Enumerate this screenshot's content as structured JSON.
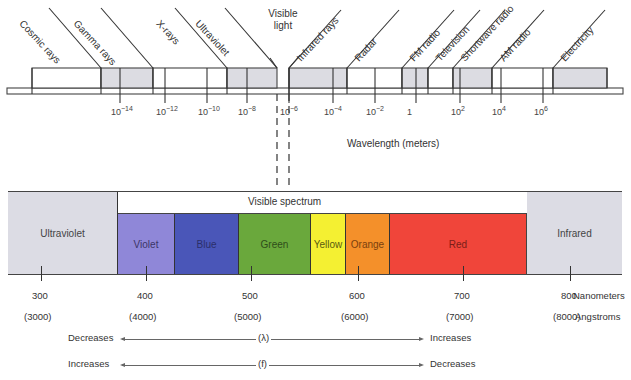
{
  "top_scale": {
    "regions": [
      {
        "label": "Cosmic rays",
        "x0": 32,
        "x1": 101,
        "shaded": false,
        "line_top_x": 44
      },
      {
        "label": "Gamma rays",
        "x0": 101,
        "x1": 153,
        "shaded": true,
        "line_top_x": 96
      },
      {
        "label": "X-rays",
        "x0": 153,
        "x1": 227,
        "shaded": false,
        "line_top_x": 169
      },
      {
        "label": "Ultraviolet",
        "x0": 227,
        "x1": 277,
        "shaded": true,
        "line_top_x": 221
      },
      {
        "label": "Visible light",
        "x0": 277,
        "x1": 289,
        "shaded": false
      },
      {
        "label": "Infrared rays",
        "x0": 289,
        "x1": 347,
        "shaded": true,
        "line_top_x": 347
      },
      {
        "label": "Radar",
        "x0": 347,
        "x1": 402,
        "shaded": false,
        "line_top_x": 404
      },
      {
        "label": "FM radio",
        "x0": 402,
        "x1": 428,
        "shaded": true,
        "line_top_x": 430
      },
      {
        "label": "Television",
        "x0": 428,
        "x1": 453,
        "shaded": false,
        "line_top_x": 456
      },
      {
        "label": "Shortwave radio",
        "x0": 453,
        "x1": 492,
        "shaded": true,
        "line_top_x": 495
      },
      {
        "label": "AM radio",
        "x0": 492,
        "x1": 553,
        "shaded": false,
        "line_top_x": 548
      },
      {
        "label": "Electricity",
        "x0": 553,
        "x1": 607,
        "shaded": true,
        "line_top_x": 612
      }
    ],
    "visible_light_label": [
      "Visible",
      "light"
    ],
    "ticks": [
      {
        "label": "10",
        "exp": "−14",
        "x": 120
      },
      {
        "label": "10",
        "exp": "−12",
        "x": 165
      },
      {
        "label": "10",
        "exp": "−10",
        "x": 207
      },
      {
        "label": "10",
        "exp": "−8",
        "x": 247
      },
      {
        "label": "10",
        "exp": "−6",
        "x": 289
      },
      {
        "label": "10",
        "exp": "−4",
        "x": 333
      },
      {
        "label": "10",
        "exp": "−2",
        "x": 375
      },
      {
        "label": "1",
        "exp": "",
        "x": 416
      },
      {
        "label": "10",
        "exp": "2",
        "x": 460
      },
      {
        "label": "10",
        "exp": "4",
        "x": 501
      },
      {
        "label": "10",
        "exp": "6",
        "x": 543
      }
    ],
    "axis_title": "Wavelength (meters)"
  },
  "visible_spectrum": {
    "title": "Visible spectrum",
    "bands": [
      {
        "label": "Ultraviolet",
        "x0": 8,
        "x1": 118,
        "color": "#dcdce4",
        "text_color": "#444444"
      },
      {
        "label": "Violet",
        "x0": 118,
        "x1": 175,
        "color": "#8f87d8",
        "text_color": "#3b3566"
      },
      {
        "label": "Blue",
        "x0": 175,
        "x1": 239,
        "color": "#4a56b8",
        "text_color": "#2a2f6a"
      },
      {
        "label": "Green",
        "x0": 239,
        "x1": 311,
        "color": "#6aa83c",
        "text_color": "#2f4d1a"
      },
      {
        "label": "Yellow",
        "x0": 311,
        "x1": 346,
        "color": "#f4f032",
        "text_color": "#5a5a10"
      },
      {
        "label": "Orange",
        "x0": 346,
        "x1": 390,
        "color": "#f4902a",
        "text_color": "#7a3f0e"
      },
      {
        "label": "Red",
        "x0": 390,
        "x1": 527,
        "color": "#f0453a",
        "text_color": "#7a1e18"
      },
      {
        "label": "Infrared",
        "x0": 527,
        "x1": 622,
        "color": "#dcdce4",
        "text_color": "#444444"
      }
    ],
    "ticks": [
      {
        "nm": "300",
        "angstrom": "(3000)",
        "x": 41
      },
      {
        "nm": "400",
        "angstrom": "(4000)",
        "x": 146
      },
      {
        "nm": "500",
        "angstrom": "(5000)",
        "x": 251
      },
      {
        "nm": "600",
        "angstrom": "(6000)",
        "x": 358
      },
      {
        "nm": "700",
        "angstrom": "(7000)",
        "x": 463
      },
      {
        "nm": "800",
        "angstrom": "(8000)",
        "x": 570
      }
    ],
    "unit_nm": "Nanometers",
    "unit_angstrom": "Angstroms"
  },
  "arrows": [
    {
      "left": "Decreases",
      "symbol": "(λ)",
      "right": "Increases"
    },
    {
      "left": "Increases",
      "symbol": "(f)",
      "right": "Decreases"
    }
  ]
}
